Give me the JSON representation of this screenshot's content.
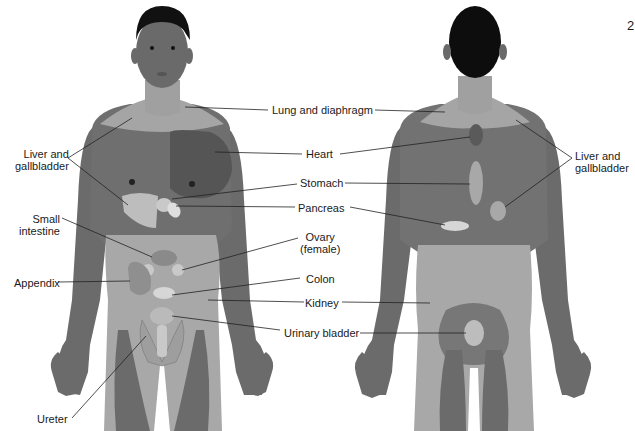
{
  "figure": {
    "corner_mark": "2",
    "colors": {
      "skin_dark": "#6b6b6b",
      "skin_mid": "#858585",
      "skin_light": "#a8a8a8",
      "zone_light": "#bdbdbd",
      "organ": "#c9c9c9",
      "organ_light": "#dedede",
      "heart_zone": "#555555",
      "hair": "#111111",
      "leader_line": "#222222"
    },
    "front_view": {
      "labels": [
        {
          "id": "lung-diaphragm",
          "text": "Lung and diaphragm"
        },
        {
          "id": "heart",
          "text": "Heart"
        },
        {
          "id": "stomach",
          "text": "Stomach"
        },
        {
          "id": "pancreas",
          "text": "Pancreas"
        },
        {
          "id": "ovary",
          "text": "Ovary\n(female)"
        },
        {
          "id": "colon",
          "text": "Colon"
        },
        {
          "id": "kidney",
          "text": "Kidney"
        },
        {
          "id": "urinary-bladder",
          "text": "Urinary bladder"
        },
        {
          "id": "liver-gallbladder-left",
          "text": "Liver and\ngallbladder"
        },
        {
          "id": "small-intestine",
          "text": "Small\nintestine"
        },
        {
          "id": "appendix",
          "text": "Appendix"
        },
        {
          "id": "ureter",
          "text": "Ureter"
        }
      ]
    },
    "back_view": {
      "labels": [
        {
          "id": "liver-gallbladder-right",
          "text": "Liver and\ngallbladder"
        }
      ]
    }
  }
}
